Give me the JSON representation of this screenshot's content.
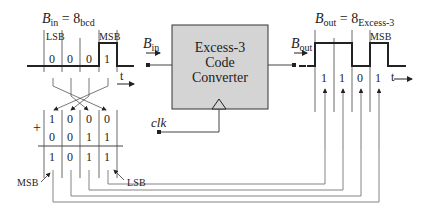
{
  "input": {
    "title_var": "B",
    "title_sub": "in",
    "title_eq": " = 8",
    "title_code": "bcd",
    "lsb_label": "LSB",
    "msb_label": "MSB",
    "bits": [
      "0",
      "0",
      "0",
      "1"
    ],
    "time_label": "t",
    "arrow_label_var": "B",
    "arrow_label_sub": "in"
  },
  "converter": {
    "lines": [
      "Excess-3",
      "Code",
      "Converter"
    ],
    "clock_label": "clk",
    "fill_color": "#d4d4d4"
  },
  "output": {
    "title_var": "B",
    "title_sub": "out",
    "title_eq": " = 8",
    "title_code": "Excess-3",
    "msb_label": "MSB",
    "bits": [
      "1",
      "1",
      "0",
      "1"
    ],
    "time_label": "t",
    "arrow_label_var": "B",
    "arrow_label_sub": "out"
  },
  "addition": {
    "operator": "+",
    "row1": [
      "1",
      "0",
      "0",
      "0"
    ],
    "row2": [
      "0",
      "0",
      "1",
      "1"
    ],
    "result": [
      "1",
      "0",
      "1",
      "1"
    ],
    "msb_label": "MSB",
    "lsb_label": "LSB"
  }
}
